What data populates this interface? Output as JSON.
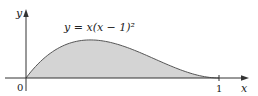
{
  "chart_data": {
    "type": "area",
    "title": "",
    "function_label": "y = x(x − 1)²",
    "xlabel": "x",
    "ylabel": "y",
    "tick_labels": {
      "origin": "0",
      "x_one": "1"
    },
    "x": [
      0,
      0.05,
      0.1,
      0.15,
      0.2,
      0.25,
      0.3,
      0.333,
      0.4,
      0.45,
      0.5,
      0.55,
      0.6,
      0.65,
      0.7,
      0.75,
      0.8,
      0.85,
      0.9,
      0.95,
      1
    ],
    "values": [
      0,
      0.0451,
      0.081,
      0.1084,
      0.128,
      0.1406,
      0.147,
      0.1481,
      0.144,
      0.1361,
      0.125,
      0.1114,
      0.096,
      0.0796,
      0.063,
      0.0469,
      0.032,
      0.0191,
      0.009,
      0.0024,
      0
    ],
    "xlim": [
      0,
      1.15
    ],
    "ylim": [
      0,
      0.26
    ],
    "grid": false,
    "legend": null,
    "fill_color": "#d4d4d4",
    "curve_color": "#555555",
    "axis_color": "#333333"
  }
}
